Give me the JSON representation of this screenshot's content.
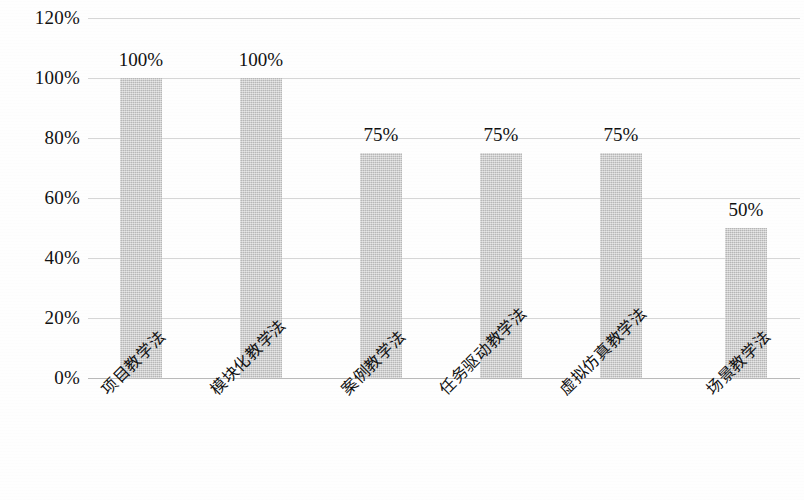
{
  "chart_data": {
    "type": "bar",
    "title": "",
    "xlabel": "",
    "ylabel": "",
    "categories": [
      "项目教学法",
      "模块化教学法",
      "案例教学法",
      "任务驱动教学法",
      "虚拟仿真教学法",
      "场景教学法"
    ],
    "values": [
      100,
      100,
      75,
      75,
      75,
      50
    ],
    "value_labels": [
      "100%",
      "100%",
      "75%",
      "75%",
      "75%",
      "50%"
    ],
    "ylim": [
      0,
      120
    ],
    "ytick_values": [
      0,
      20,
      40,
      60,
      80,
      100,
      120
    ],
    "ytick_labels": [
      "0%",
      "20%",
      "40%",
      "60%",
      "80%",
      "100%",
      "120%"
    ],
    "grid": true,
    "legend": "none",
    "bar_color": "#c9c9c9",
    "gridline_color": "#d6d6d6",
    "axis_color": "#b9b9b9",
    "text_color": "#111111"
  }
}
